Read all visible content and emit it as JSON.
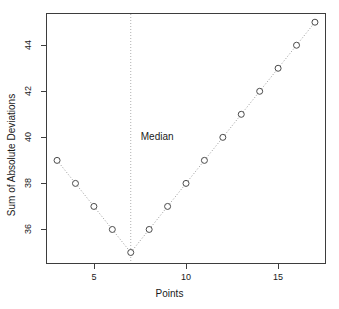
{
  "chart_data": {
    "type": "scatter",
    "title": "",
    "xlabel": "Points",
    "ylabel": "Sum of Absolute Deviations",
    "x": [
      3,
      4,
      5,
      6,
      7,
      8,
      9,
      10,
      11,
      12,
      13,
      14,
      15,
      16,
      17
    ],
    "values": [
      39,
      38,
      37,
      36,
      35,
      36,
      37,
      38,
      39,
      40,
      41,
      42,
      43,
      44,
      45
    ],
    "xlim": [
      2.4,
      17.6
    ],
    "ylim": [
      34.5,
      45.4
    ],
    "xticks": [
      5,
      10,
      15
    ],
    "xtick_labels": [
      "5",
      "10",
      "15"
    ],
    "yticks": [
      36,
      38,
      40,
      42,
      44
    ],
    "ytick_labels": [
      "36",
      "38",
      "40",
      "42",
      "44"
    ],
    "grid": false,
    "legend": null,
    "marker": "open-circle",
    "line_style": "dotted",
    "annotations": [
      {
        "name": "median-line",
        "type": "vline",
        "x": 7,
        "label": "Median",
        "style": "dotted"
      }
    ],
    "series": [
      {
        "name": "Sum of Absolute Deviations",
        "values": [
          39,
          38,
          37,
          36,
          35,
          36,
          37,
          38,
          39,
          40,
          41,
          42,
          43,
          44,
          45
        ]
      }
    ],
    "colors": {
      "marker_stroke": "#4a4a4a",
      "line": "#9a9a9a",
      "axis": "#3d3d3d",
      "text": "#1a1a1a"
    }
  },
  "labels": {
    "median": "Median",
    "x_title": "Points",
    "y_title": "Sum of Absolute Deviations"
  }
}
